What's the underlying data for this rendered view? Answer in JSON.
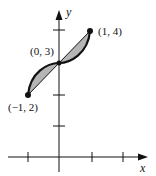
{
  "diagram": {
    "axes": {
      "x_label": "x",
      "y_label": "y"
    },
    "points": [
      {
        "label": "(−1, 2)",
        "x": -1,
        "y": 2
      },
      {
        "label": "(0, 3)",
        "x": 0,
        "y": 3
      },
      {
        "label": "(1, 4)",
        "x": 1,
        "y": 4
      }
    ],
    "x_ticks": [
      -1,
      1,
      2
    ],
    "y_ticks": [
      1,
      2,
      3,
      4
    ],
    "colors": {
      "shade": "#b5b5b5",
      "ink": "#111111"
    }
  }
}
